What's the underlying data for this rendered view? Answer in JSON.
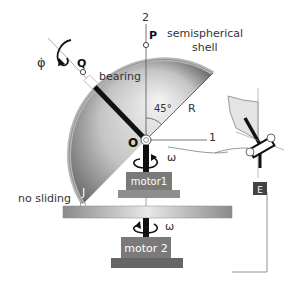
{
  "labels": {
    "axis2": "2",
    "axis1": "1",
    "point_P": "P",
    "point_Q": "Q",
    "point_O": "O",
    "point_J": "J",
    "shell_line1": "semispherical",
    "shell_line2": "shell",
    "bearing": "bearing",
    "angle": "45°",
    "radius": "R",
    "phi_dot": "φ̇",
    "omega1": "ω",
    "omega2": "ω",
    "no_sliding": "no sliding",
    "motor1": "motor1",
    "motor2": "motor 2",
    "inset_tag": "E"
  },
  "colors": {
    "shell_dark": "#5a5a5a",
    "shell_light": "#f2f2f2",
    "shell_rim": "#b8b8b8",
    "motor_box": "#7a7a7a",
    "motor_base": "#666666",
    "platform": "#a0a0a0",
    "rod": "#111111",
    "inset_tag_bg": "#444444"
  }
}
